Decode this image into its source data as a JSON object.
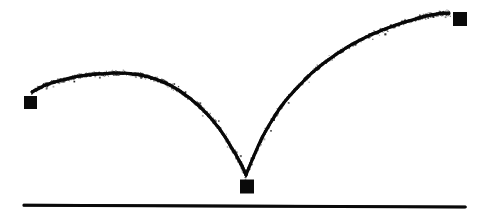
{
  "figure": {
    "kind": "hand-drawn-sketch",
    "width": 488,
    "height": 220,
    "background_color": "#ffffff",
    "ink_color": "#0a0a0a",
    "stroke_style": "rough-pencil",
    "has_text_labels": false,
    "has_axis_ticks": false,
    "has_legend": false
  },
  "chart_data": {
    "type": "line",
    "xlabel": "",
    "ylabel": "",
    "xlim": [
      0,
      488
    ],
    "ylim": [
      220,
      0
    ],
    "grid": false,
    "legend": "none",
    "axes": {
      "baseline": {
        "name": "ground-line",
        "x_start": 24,
        "y_start": 205,
        "x_end": 465,
        "y_end": 207,
        "thickness": 3,
        "color": "#0a0a0a"
      }
    },
    "series": [
      {
        "name": "first-arc",
        "description": "rising-then-falling arc from launch marker down to bounce point",
        "points": [
          [
            32,
            92
          ],
          [
            46,
            85
          ],
          [
            62,
            80
          ],
          [
            80,
            76
          ],
          [
            100,
            74
          ],
          [
            120,
            73
          ],
          [
            140,
            75
          ],
          [
            158,
            80
          ],
          [
            175,
            88
          ],
          [
            192,
            100
          ],
          [
            207,
            114
          ],
          [
            221,
            131
          ],
          [
            233,
            150
          ],
          [
            241,
            164
          ],
          [
            246,
            175
          ]
        ]
      },
      {
        "name": "second-arc",
        "description": "rebound arc rising from bounce point up to landing marker",
        "points": [
          [
            246,
            175
          ],
          [
            253,
            158
          ],
          [
            261,
            140
          ],
          [
            271,
            122
          ],
          [
            283,
            104
          ],
          [
            297,
            88
          ],
          [
            313,
            72
          ],
          [
            331,
            58
          ],
          [
            351,
            45
          ],
          [
            373,
            34
          ],
          [
            396,
            25
          ],
          [
            419,
            18
          ],
          [
            437,
            14
          ],
          [
            449,
            13
          ]
        ]
      }
    ],
    "markers": [
      {
        "name": "start-marker",
        "label": "",
        "shape": "square",
        "x": 30.5,
        "y": 102.5,
        "size": 13,
        "color": "#0a0a0a"
      },
      {
        "name": "bounce-marker",
        "label": "",
        "shape": "square",
        "x": 247,
        "y": 186.5,
        "size": 14,
        "color": "#0a0a0a"
      },
      {
        "name": "end-marker",
        "label": "",
        "shape": "square",
        "x": 460,
        "y": 19,
        "size": 14,
        "color": "#0a0a0a"
      }
    ]
  }
}
